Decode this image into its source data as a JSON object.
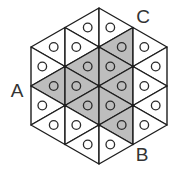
{
  "diagram": {
    "colors": {
      "background": "#ffffff",
      "line": "#1e1e1e",
      "shaded_fill": "#bdbdbd",
      "unshaded_fill": "#ffffff",
      "label": "#333333"
    },
    "labels": [
      {
        "id": "A",
        "text": "A",
        "x": 17,
        "y": 97
      },
      {
        "id": "B",
        "text": "B",
        "x": 142,
        "y": 161
      },
      {
        "id": "C",
        "text": "C",
        "x": 143,
        "y": 23
      }
    ],
    "circle_radius": 4.3,
    "triangles": [
      {
        "pts": [
          [
            31,
            47
          ],
          [
            65,
            27.5
          ],
          [
            65,
            66.5
          ]
        ],
        "shaded": false
      },
      {
        "pts": [
          [
            31,
            47
          ],
          [
            31,
            86
          ],
          [
            65,
            66.5
          ]
        ],
        "shaded": false
      },
      {
        "pts": [
          [
            31,
            86
          ],
          [
            65,
            66.5
          ],
          [
            65,
            105.5
          ]
        ],
        "shaded": true
      },
      {
        "pts": [
          [
            31,
            86
          ],
          [
            31,
            125
          ],
          [
            65,
            105.5
          ]
        ],
        "shaded": false
      },
      {
        "pts": [
          [
            31,
            125
          ],
          [
            65,
            105.5
          ],
          [
            65,
            144.5
          ]
        ],
        "shaded": false
      },
      {
        "pts": [
          [
            65,
            27.5
          ],
          [
            99,
            8
          ],
          [
            99,
            47
          ]
        ],
        "shaded": false
      },
      {
        "pts": [
          [
            65,
            27.5
          ],
          [
            65,
            66.5
          ],
          [
            99,
            47
          ]
        ],
        "shaded": false
      },
      {
        "pts": [
          [
            65,
            66.5
          ],
          [
            99,
            47
          ],
          [
            99,
            86
          ]
        ],
        "shaded": true
      },
      {
        "pts": [
          [
            65,
            66.5
          ],
          [
            65,
            105.5
          ],
          [
            99,
            86
          ]
        ],
        "shaded": true
      },
      {
        "pts": [
          [
            65,
            105.5
          ],
          [
            99,
            86
          ],
          [
            99,
            125
          ]
        ],
        "shaded": true
      },
      {
        "pts": [
          [
            65,
            105.5
          ],
          [
            65,
            144.5
          ],
          [
            99,
            125
          ]
        ],
        "shaded": false
      },
      {
        "pts": [
          [
            65,
            144.5
          ],
          [
            99,
            125
          ],
          [
            99,
            164
          ]
        ],
        "shaded": false
      },
      {
        "pts": [
          [
            99,
            8
          ],
          [
            99,
            47
          ],
          [
            133,
            27.5
          ]
        ],
        "shaded": false
      },
      {
        "pts": [
          [
            99,
            47
          ],
          [
            133,
            27.5
          ],
          [
            133,
            66.5
          ]
        ],
        "shaded": true
      },
      {
        "pts": [
          [
            99,
            47
          ],
          [
            99,
            86
          ],
          [
            133,
            66.5
          ]
        ],
        "shaded": true
      },
      {
        "pts": [
          [
            99,
            86
          ],
          [
            133,
            66.5
          ],
          [
            133,
            105.5
          ]
        ],
        "shaded": true
      },
      {
        "pts": [
          [
            99,
            86
          ],
          [
            99,
            125
          ],
          [
            133,
            105.5
          ]
        ],
        "shaded": true
      },
      {
        "pts": [
          [
            99,
            125
          ],
          [
            133,
            105.5
          ],
          [
            133,
            144.5
          ]
        ],
        "shaded": true
      },
      {
        "pts": [
          [
            99,
            125
          ],
          [
            99,
            164
          ],
          [
            133,
            144.5
          ]
        ],
        "shaded": false
      },
      {
        "pts": [
          [
            133,
            27.5
          ],
          [
            133,
            66.5
          ],
          [
            167,
            47
          ]
        ],
        "shaded": false
      },
      {
        "pts": [
          [
            133,
            66.5
          ],
          [
            167,
            47
          ],
          [
            167,
            86
          ]
        ],
        "shaded": false
      },
      {
        "pts": [
          [
            133,
            66.5
          ],
          [
            133,
            105.5
          ],
          [
            167,
            86
          ]
        ],
        "shaded": false
      },
      {
        "pts": [
          [
            133,
            105.5
          ],
          [
            167,
            86
          ],
          [
            167,
            125
          ]
        ],
        "shaded": false
      },
      {
        "pts": [
          [
            133,
            105.5
          ],
          [
            133,
            144.5
          ],
          [
            167,
            125
          ]
        ],
        "shaded": false
      }
    ],
    "interior_nodes": [
      [
        65,
        66.5
      ],
      [
        65,
        105.5
      ],
      [
        99,
        47
      ],
      [
        99,
        86
      ],
      [
        99,
        125
      ],
      [
        133,
        66.5
      ],
      [
        133,
        105.5
      ]
    ]
  }
}
